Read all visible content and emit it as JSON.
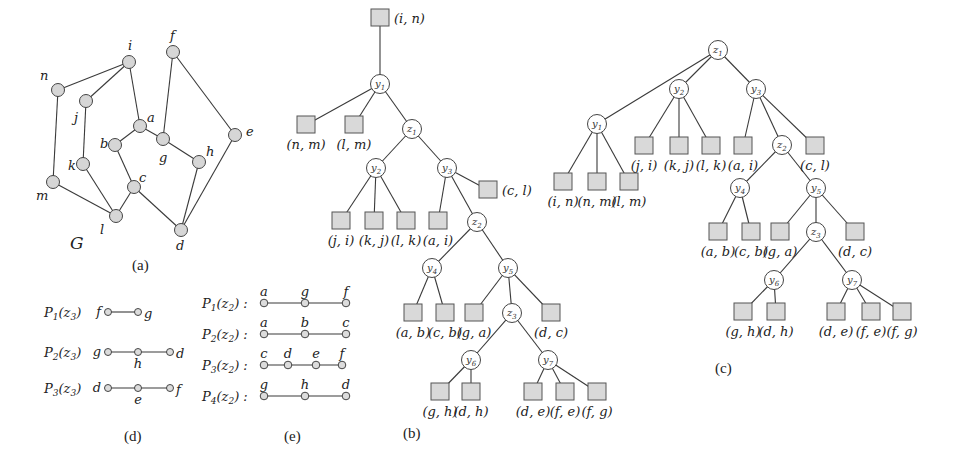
{
  "panel_a": {
    "caption": "(a)",
    "graph_label": "G",
    "nodes": [
      {
        "id": "n",
        "label": "n",
        "x": 58,
        "y": 90,
        "lx": 40,
        "ly": 80
      },
      {
        "id": "i",
        "label": "i",
        "x": 129,
        "y": 62,
        "lx": 128,
        "ly": 50
      },
      {
        "id": "f",
        "label": "f",
        "x": 173,
        "y": 52,
        "lx": 170,
        "ly": 40
      },
      {
        "id": "j",
        "label": "j",
        "x": 86,
        "y": 101,
        "lx": 74,
        "ly": 122
      },
      {
        "id": "a",
        "label": "a",
        "x": 140,
        "y": 126,
        "lx": 147,
        "ly": 122
      },
      {
        "id": "e",
        "label": "e",
        "x": 235,
        "y": 135,
        "lx": 246,
        "ly": 136
      },
      {
        "id": "b",
        "label": "b",
        "x": 115,
        "y": 145,
        "lx": 100,
        "ly": 148
      },
      {
        "id": "g",
        "label": "g",
        "x": 163,
        "y": 139,
        "lx": 159,
        "ly": 162
      },
      {
        "id": "h",
        "label": "h",
        "x": 199,
        "y": 162,
        "lx": 206,
        "ly": 156
      },
      {
        "id": "k",
        "label": "k",
        "x": 83,
        "y": 164,
        "lx": 68,
        "ly": 170
      },
      {
        "id": "c",
        "label": "c",
        "x": 134,
        "y": 187,
        "lx": 139,
        "ly": 182
      },
      {
        "id": "m",
        "label": "m",
        "x": 53,
        "y": 182,
        "lx": 36,
        "ly": 200
      },
      {
        "id": "l",
        "label": "l",
        "x": 116,
        "y": 216,
        "lx": 100,
        "ly": 234
      },
      {
        "id": "d",
        "label": "d",
        "x": 181,
        "y": 230,
        "lx": 176,
        "ly": 250
      }
    ],
    "edges": [
      [
        "n",
        "i"
      ],
      [
        "i",
        "j"
      ],
      [
        "i",
        "a"
      ],
      [
        "n",
        "m"
      ],
      [
        "j",
        "k"
      ],
      [
        "k",
        "l"
      ],
      [
        "m",
        "l"
      ],
      [
        "l",
        "c"
      ],
      [
        "b",
        "c"
      ],
      [
        "a",
        "b"
      ],
      [
        "a",
        "g"
      ],
      [
        "f",
        "g"
      ],
      [
        "f",
        "e"
      ],
      [
        "g",
        "h"
      ],
      [
        "h",
        "d"
      ],
      [
        "e",
        "d"
      ],
      [
        "c",
        "d"
      ]
    ]
  },
  "panel_d": {
    "caption": "(d)",
    "paths": [
      {
        "label": "P1(z3)",
        "nodes": [
          {
            "name": "f",
            "pos": "left"
          },
          {
            "name": "g",
            "pos": "right"
          }
        ]
      },
      {
        "label": "P2(z3)",
        "nodes": [
          {
            "name": "g",
            "pos": "left"
          },
          {
            "name": "h",
            "pos": "below"
          },
          {
            "name": "d",
            "pos": "right"
          }
        ]
      },
      {
        "label": "P3(z3)",
        "nodes": [
          {
            "name": "d",
            "pos": "left"
          },
          {
            "name": "e",
            "pos": "below"
          },
          {
            "name": "f",
            "pos": "right"
          }
        ]
      }
    ]
  },
  "panel_e": {
    "caption": "(e)",
    "paths": [
      {
        "label": "P1(z2) :",
        "nodes": [
          "a",
          "g",
          "f"
        ]
      },
      {
        "label": "P2(z2) :",
        "nodes": [
          "a",
          "b",
          "c"
        ]
      },
      {
        "label": "P3(z2) :",
        "nodes": [
          "c",
          "d",
          "e",
          "f"
        ]
      },
      {
        "label": "P4(z2) :",
        "nodes": [
          "g",
          "h",
          "d"
        ]
      }
    ]
  },
  "panel_b": {
    "caption": "(b)",
    "internal_nodes": [
      {
        "id": "y1",
        "label": "y1",
        "x": 380,
        "y": 84
      },
      {
        "id": "z1",
        "label": "z1",
        "x": 412,
        "y": 129
      },
      {
        "id": "y2",
        "label": "y2",
        "x": 376,
        "y": 168
      },
      {
        "id": "y3",
        "label": "y3",
        "x": 447,
        "y": 168
      },
      {
        "id": "z2",
        "label": "z2",
        "x": 477,
        "y": 222
      },
      {
        "id": "y4",
        "label": "y4",
        "x": 432,
        "y": 268
      },
      {
        "id": "y5",
        "label": "y5",
        "x": 508,
        "y": 268
      },
      {
        "id": "z3",
        "label": "z3",
        "x": 512,
        "y": 313
      },
      {
        "id": "y6",
        "label": "y6",
        "x": 471,
        "y": 360
      },
      {
        "id": "y7",
        "label": "y7",
        "x": 548,
        "y": 360
      }
    ],
    "leaves": [
      {
        "id": "in",
        "label": "(i, n)",
        "x": 380,
        "y": 18,
        "lpos": "right"
      },
      {
        "id": "nm",
        "label": "(n, m)",
        "x": 306,
        "y": 125,
        "lpos": "below"
      },
      {
        "id": "lm",
        "label": "(l, m)",
        "x": 354,
        "y": 125,
        "lpos": "below"
      },
      {
        "id": "cl",
        "label": "(c, l)",
        "x": 488,
        "y": 190,
        "lpos": "right"
      },
      {
        "id": "ji",
        "label": "(j, i)",
        "x": 341,
        "y": 221,
        "lpos": "below"
      },
      {
        "id": "kj",
        "label": "(k, j)",
        "x": 374,
        "y": 221,
        "lpos": "below"
      },
      {
        "id": "lk",
        "label": "(l, k)",
        "x": 406,
        "y": 221,
        "lpos": "below"
      },
      {
        "id": "ai",
        "label": "(a, i)",
        "x": 438,
        "y": 221,
        "lpos": "below"
      },
      {
        "id": "ab",
        "label": "(a, b)",
        "x": 413,
        "y": 313,
        "lpos": "below"
      },
      {
        "id": "cb",
        "label": "(c, b)",
        "x": 445,
        "y": 313,
        "lpos": "below"
      },
      {
        "id": "ga",
        "label": "(g, a)",
        "x": 474,
        "y": 313,
        "lpos": "below"
      },
      {
        "id": "dc",
        "label": "(d, c)",
        "x": 551,
        "y": 313,
        "lpos": "below"
      },
      {
        "id": "gh",
        "label": "(g, h)",
        "x": 440,
        "y": 392,
        "lpos": "below"
      },
      {
        "id": "dh",
        "label": "(d, h)",
        "x": 471,
        "y": 392,
        "lpos": "below"
      },
      {
        "id": "de",
        "label": "(d, e)",
        "x": 533,
        "y": 392,
        "lpos": "below"
      },
      {
        "id": "fe",
        "label": "(f, e)",
        "x": 565,
        "y": 392,
        "lpos": "below"
      },
      {
        "id": "fg",
        "label": "(f, g)",
        "x": 597,
        "y": 392,
        "lpos": "below"
      }
    ],
    "edges": [
      [
        "in",
        "y1"
      ],
      [
        "y1",
        "nm"
      ],
      [
        "y1",
        "lm"
      ],
      [
        "y1",
        "z1"
      ],
      [
        "z1",
        "y2"
      ],
      [
        "z1",
        "y3"
      ],
      [
        "y2",
        "ji"
      ],
      [
        "y2",
        "kj"
      ],
      [
        "y2",
        "lk"
      ],
      [
        "y3",
        "ai"
      ],
      [
        "y3",
        "z2"
      ],
      [
        "y3",
        "cl"
      ],
      [
        "z2",
        "y4"
      ],
      [
        "z2",
        "y5"
      ],
      [
        "y4",
        "ab"
      ],
      [
        "y4",
        "cb"
      ],
      [
        "y5",
        "ga"
      ],
      [
        "y5",
        "z3"
      ],
      [
        "y5",
        "dc"
      ],
      [
        "z3",
        "y6"
      ],
      [
        "z3",
        "y7"
      ],
      [
        "y6",
        "gh"
      ],
      [
        "y6",
        "dh"
      ],
      [
        "y7",
        "de"
      ],
      [
        "y7",
        "fe"
      ],
      [
        "y7",
        "fg"
      ]
    ]
  },
  "panel_c": {
    "caption": "(c)",
    "internal_nodes": [
      {
        "id": "z1",
        "label": "z1",
        "x": 718,
        "y": 50
      },
      {
        "id": "y2",
        "label": "y2",
        "x": 679,
        "y": 89
      },
      {
        "id": "y3",
        "label": "y3",
        "x": 756,
        "y": 89
      },
      {
        "id": "y1",
        "label": "y1",
        "x": 597,
        "y": 124
      },
      {
        "id": "z2",
        "label": "z2",
        "x": 782,
        "y": 145
      },
      {
        "id": "y4",
        "label": "y4",
        "x": 740,
        "y": 188
      },
      {
        "id": "y5",
        "label": "y5",
        "x": 816,
        "y": 188
      },
      {
        "id": "z3",
        "label": "z3",
        "x": 816,
        "y": 232
      },
      {
        "id": "y6",
        "label": "y6",
        "x": 774,
        "y": 280
      },
      {
        "id": "y7",
        "label": "y7",
        "x": 852,
        "y": 280
      }
    ],
    "leaves": [
      {
        "id": "ji",
        "label": "(j, i)",
        "x": 644,
        "y": 146
      },
      {
        "id": "kj",
        "label": "(k, j)",
        "x": 679,
        "y": 146
      },
      {
        "id": "lk",
        "label": "(l, k)",
        "x": 711,
        "y": 146
      },
      {
        "id": "ai",
        "label": "(a, i)",
        "x": 743,
        "y": 146
      },
      {
        "id": "cl",
        "label": "(c, l)",
        "x": 815,
        "y": 146
      },
      {
        "id": "in",
        "label": "(i, n)",
        "x": 563,
        "y": 182
      },
      {
        "id": "nm",
        "label": "(n, m)",
        "x": 597,
        "y": 182
      },
      {
        "id": "lm",
        "label": "(l, m)",
        "x": 629,
        "y": 182
      },
      {
        "id": "ab",
        "label": "(a, b)",
        "x": 718,
        "y": 232
      },
      {
        "id": "cb",
        "label": "(c, b)",
        "x": 751,
        "y": 232
      },
      {
        "id": "ga",
        "label": "(g, a)",
        "x": 780,
        "y": 232
      },
      {
        "id": "dc",
        "label": "(d, c)",
        "x": 855,
        "y": 232
      },
      {
        "id": "gh",
        "label": "(g, h)",
        "x": 743,
        "y": 312
      },
      {
        "id": "dh",
        "label": "(d, h)",
        "x": 776,
        "y": 312
      },
      {
        "id": "de",
        "label": "(d, e)",
        "x": 836,
        "y": 312
      },
      {
        "id": "fe",
        "label": "(f, e)",
        "x": 871,
        "y": 312
      },
      {
        "id": "fg",
        "label": "(f, g)",
        "x": 902,
        "y": 312
      }
    ],
    "edges": [
      [
        "z1",
        "y1"
      ],
      [
        "z1",
        "y2"
      ],
      [
        "z1",
        "y3"
      ],
      [
        "y1",
        "in"
      ],
      [
        "y1",
        "nm"
      ],
      [
        "y1",
        "lm"
      ],
      [
        "y2",
        "ji"
      ],
      [
        "y2",
        "kj"
      ],
      [
        "y2",
        "lk"
      ],
      [
        "y3",
        "ai"
      ],
      [
        "y3",
        "z2"
      ],
      [
        "y3",
        "cl"
      ],
      [
        "z2",
        "y4"
      ],
      [
        "z2",
        "y5"
      ],
      [
        "y4",
        "ab"
      ],
      [
        "y4",
        "cb"
      ],
      [
        "y5",
        "ga"
      ],
      [
        "y5",
        "z3"
      ],
      [
        "y5",
        "dc"
      ],
      [
        "z3",
        "y6"
      ],
      [
        "z3",
        "y7"
      ],
      [
        "y6",
        "gh"
      ],
      [
        "y6",
        "dh"
      ],
      [
        "y7",
        "de"
      ],
      [
        "y7",
        "fe"
      ],
      [
        "y7",
        "fg"
      ]
    ]
  }
}
